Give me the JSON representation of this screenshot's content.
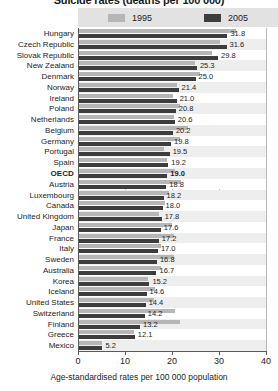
{
  "chart_data": {
    "type": "bar",
    "orientation": "horizontal",
    "title": "Suicide rates (deaths per 100 000)",
    "xlabel": "Age-standardised rates per 100 000 population",
    "ylabel": "",
    "xlim": [
      0,
      40
    ],
    "xticks": [
      0,
      10,
      20,
      30,
      40
    ],
    "grid": true,
    "legend_position": "top",
    "categories": [
      "Hungary",
      "Czech Republic",
      "Slovak Republic",
      "New Zealand",
      "Denmark",
      "Norway",
      "Ireland",
      "Poland",
      "Netherlands",
      "Belgium",
      "Germany",
      "Portugal",
      "Spain",
      "OECD",
      "Austria",
      "Luxembourg",
      "Canada",
      "United Kingdom",
      "Japan",
      "France",
      "Italy",
      "Sweden",
      "Australia",
      "Korea",
      "Iceland",
      "United States",
      "Switzerland",
      "Finland",
      "Greece",
      "Mexico"
    ],
    "highlight_category": "OECD",
    "series": [
      {
        "name": "1995",
        "color": "#b6b6b6",
        "values": [
          33.6,
          30.2,
          28.6,
          24.8,
          26.0,
          21.0,
          20.2,
          21.6,
          20.4,
          23.4,
          21.6,
          18.2,
          19.0,
          20.6,
          22.0,
          19.4,
          18.6,
          17.2,
          20.0,
          20.4,
          17.6,
          20.4,
          17.6,
          14.8,
          16.4,
          16.2,
          20.6,
          21.6,
          12.0,
          5.0
        ]
      },
      {
        "name": "2005",
        "color": "#3d3d3d",
        "values": [
          31.8,
          31.6,
          29.8,
          25.3,
          25.0,
          21.4,
          21.0,
          20.8,
          20.6,
          20.2,
          19.8,
          19.5,
          19.2,
          19.0,
          18.8,
          18.2,
          18.0,
          17.8,
          17.6,
          17.2,
          17.0,
          16.8,
          16.7,
          15.2,
          14.6,
          14.4,
          14.2,
          13.2,
          12.1,
          5.2
        ]
      }
    ],
    "data_labels": [
      "31.8",
      "31.6",
      "29.8",
      "25.3",
      "25.0",
      "21.4",
      "21.0",
      "20.8",
      "20.6",
      "20.2",
      "19.8",
      "19.5",
      "19.2",
      "19.0",
      "18.8",
      "18.2",
      "18.0",
      "17.8",
      "17.6",
      "17.2",
      "17.0",
      "16.8",
      "16.7",
      "15.2",
      "14.6",
      "14.4",
      "14.2",
      "13.2",
      "12.1",
      "5.2"
    ],
    "legend": [
      {
        "label": "1995",
        "color": "#b6b6b6"
      },
      {
        "label": "2005",
        "color": "#3d3d3d"
      }
    ]
  }
}
